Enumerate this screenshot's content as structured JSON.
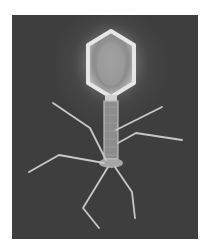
{
  "image": {
    "subject": "bacteriophage",
    "description": "Grayscale illustration of a bacteriophage with hexagonal capsid head, tail sheath and six long tail fibers on a dark background",
    "colors": {
      "page_background": "#ffffff",
      "frame_background": "#3e3e3e",
      "head_glow": "#e8e8e8",
      "structure": "#cfcfcf"
    },
    "parts": [
      "head",
      "collar",
      "tail-sheath",
      "baseplate",
      "tail-fibers"
    ]
  }
}
